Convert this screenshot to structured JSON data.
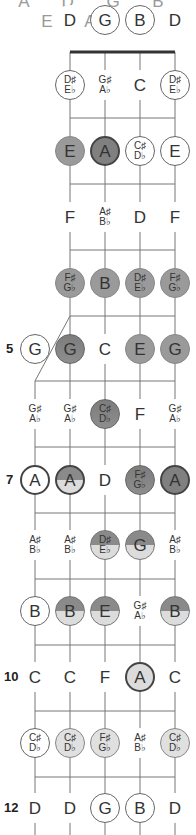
{
  "header": {
    "cutoff_text": "A D G B E A G"
  },
  "strings": {
    "x": [
      35,
      70,
      105,
      140,
      175
    ],
    "open_labels": [
      "",
      "D",
      "G",
      "B",
      "D"
    ],
    "open_styles": [
      "",
      "plain",
      "open",
      "open",
      "plain"
    ]
  },
  "nut": {
    "y": 52,
    "x1": 70,
    "x2": 175
  },
  "frets": {
    "y": [
      52,
      118,
      184,
      250,
      316,
      381,
      447,
      513,
      579,
      645,
      711,
      777,
      843
    ]
  },
  "fifth_string": {
    "start_y": 381,
    "diag_from": [
      35,
      381
    ],
    "diag_to": [
      70,
      316
    ]
  },
  "fret_numbers": [
    {
      "fret": 5,
      "label": "5"
    },
    {
      "fret": 7,
      "label": "7"
    },
    {
      "fret": 10,
      "label": "10"
    },
    {
      "fret": 12,
      "label": "12"
    }
  ],
  "rows": [
    {
      "fret": 1,
      "y": 85,
      "notes": [
        null,
        {
          "t": "D♯|E♭",
          "s": "open"
        },
        {
          "t": "G♯|A♭",
          "s": "plain"
        },
        {
          "t": "C",
          "s": "plain"
        },
        {
          "t": "D♯|E♭",
          "s": "open"
        }
      ]
    },
    {
      "fret": 2,
      "y": 151,
      "notes": [
        null,
        {
          "t": "E",
          "s": "mid"
        },
        {
          "t": "A",
          "s": "dark"
        },
        {
          "t": "C♯|D♭",
          "s": "open"
        },
        {
          "t": "E",
          "s": "open"
        }
      ]
    },
    {
      "fret": 3,
      "y": 217,
      "notes": [
        null,
        {
          "t": "F",
          "s": "plain"
        },
        {
          "t": "A♯|B♭",
          "s": "plain"
        },
        {
          "t": "D",
          "s": "plain"
        },
        {
          "t": "F",
          "s": "plain"
        }
      ]
    },
    {
      "fret": 4,
      "y": 283,
      "notes": [
        null,
        {
          "t": "F♯|G♭",
          "s": "mid"
        },
        {
          "t": "B",
          "s": "mid"
        },
        {
          "t": "D♯|E♭",
          "s": "mid"
        },
        {
          "t": "F♯|G♭",
          "s": "mid"
        }
      ]
    },
    {
      "fret": 5,
      "y": 349,
      "notes": [
        {
          "t": "G",
          "s": "open"
        },
        {
          "t": "G",
          "s": "split2"
        },
        {
          "t": "C",
          "s": "plain"
        },
        {
          "t": "E",
          "s": "mid"
        },
        {
          "t": "G",
          "s": "mid"
        }
      ]
    },
    {
      "fret": 6,
      "y": 414,
      "notes": [
        {
          "t": "G♯|A♭",
          "s": "plain"
        },
        {
          "t": "G♯|A♭",
          "s": "plain"
        },
        {
          "t": "C♯|D♭",
          "s": "split2"
        },
        {
          "t": "F",
          "s": "plain"
        },
        {
          "t": "G♯|A♭",
          "s": "plain"
        }
      ]
    },
    {
      "fret": 7,
      "y": 480,
      "notes": [
        {
          "t": "A",
          "s": "ringw"
        },
        {
          "t": "A",
          "s": "splitring"
        },
        {
          "t": "D",
          "s": "plain"
        },
        {
          "t": "F♯|G♭",
          "s": "split2"
        },
        {
          "t": "A",
          "s": "dark"
        }
      ]
    },
    {
      "fret": 8,
      "y": 545,
      "notes": [
        {
          "t": "A♯|B♭",
          "s": "plain"
        },
        {
          "t": "A♯|B♭",
          "s": "plain"
        },
        {
          "t": "D♯|E♭",
          "s": "split"
        },
        {
          "t": "G",
          "s": "split"
        },
        {
          "t": "A♯|B♭",
          "s": "plain"
        }
      ]
    },
    {
      "fret": 9,
      "y": 611,
      "notes": [
        {
          "t": "B",
          "s": "open"
        },
        {
          "t": "B",
          "s": "split"
        },
        {
          "t": "E",
          "s": "split"
        },
        {
          "t": "G♯|A♭",
          "s": "plain"
        },
        {
          "t": "B",
          "s": "split"
        }
      ]
    },
    {
      "fret": 10,
      "y": 677,
      "notes": [
        {
          "t": "C",
          "s": "plain"
        },
        {
          "t": "C",
          "s": "plain"
        },
        {
          "t": "F",
          "s": "plain"
        },
        {
          "t": "A",
          "s": "ring"
        },
        {
          "t": "C",
          "s": "plain"
        }
      ]
    },
    {
      "fret": 11,
      "y": 743,
      "notes": [
        {
          "t": "C♯|D♭",
          "s": "open"
        },
        {
          "t": "C♯|D♭",
          "s": "light"
        },
        {
          "t": "F♯|G♭",
          "s": "light"
        },
        {
          "t": "A♯|B♭",
          "s": "plain"
        },
        {
          "t": "C♯|D♭",
          "s": "light"
        }
      ]
    },
    {
      "fret": 12,
      "y": 808,
      "notes": [
        {
          "t": "D",
          "s": "plain"
        },
        {
          "t": "D",
          "s": "plain"
        },
        {
          "t": "G",
          "s": "open"
        },
        {
          "t": "B",
          "s": "open"
        },
        {
          "t": "D",
          "s": "plain"
        }
      ]
    }
  ],
  "colors": {
    "line": "#777777",
    "nut": "#333333",
    "mid": "#9a9a9a",
    "dark": "#808080",
    "light": "#dcdcdc"
  }
}
